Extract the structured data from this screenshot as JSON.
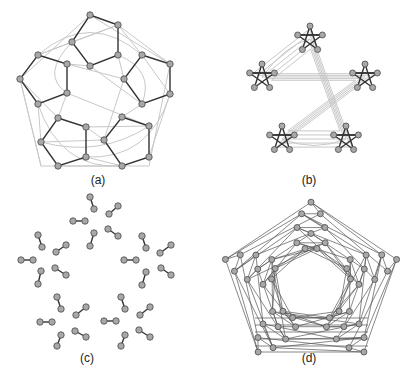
{
  "figure": {
    "panels": [
      {
        "id": "a",
        "label": "(a)",
        "description": "Dodecahedral graph with five pentagon clusters highlighted"
      },
      {
        "id": "b",
        "label": "(b)",
        "description": "Five pentagram clusters on concentric pentagon layout"
      },
      {
        "id": "c",
        "label": "(c)",
        "description": "Perfect matching: 25 disjoint edges"
      },
      {
        "id": "d",
        "label": "(d)",
        "description": "Full dense graph layout"
      }
    ],
    "colors": {
      "node_fill": "#a8a8a8",
      "node_stroke": "#555555",
      "highlight_edge": "#333333",
      "background_edge": "#c8c8c8",
      "label": "#222222"
    }
  }
}
